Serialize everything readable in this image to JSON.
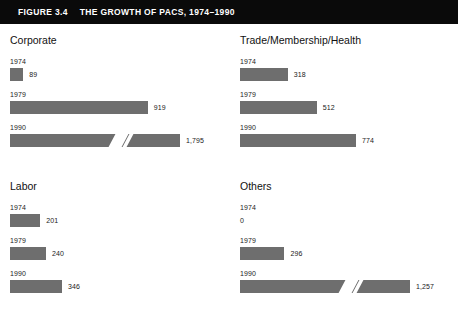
{
  "header": {
    "figure_label": "FIGURE 3.4",
    "title": "THE GROWTH OF PACS, 1974–1990"
  },
  "chart_data": {
    "type": "bar",
    "title": "THE GROWTH OF PACS, 1974–1990",
    "xlabel": "",
    "ylabel": "",
    "orientation": "horizontal",
    "grid": false,
    "legend": "none",
    "categories": [
      "1974",
      "1979",
      "1990"
    ],
    "value_axis_max": 1000,
    "panels": [
      {
        "id": "corporate",
        "title": "Corporate",
        "bars": [
          {
            "year": "1974",
            "value": 89,
            "label": "89",
            "broken": false
          },
          {
            "year": "1979",
            "value": 919,
            "label": "919",
            "broken": false
          },
          {
            "year": "1990",
            "value": 1795,
            "label": "1,795",
            "broken": true
          }
        ]
      },
      {
        "id": "trade-membership-health",
        "title": "Trade/Membership/Health",
        "bars": [
          {
            "year": "1974",
            "value": 318,
            "label": "318",
            "broken": false
          },
          {
            "year": "1979",
            "value": 512,
            "label": "512",
            "broken": false
          },
          {
            "year": "1990",
            "value": 774,
            "label": "774",
            "broken": false
          }
        ]
      },
      {
        "id": "labor",
        "title": "Labor",
        "bars": [
          {
            "year": "1974",
            "value": 201,
            "label": "201",
            "broken": false
          },
          {
            "year": "1979",
            "value": 240,
            "label": "240",
            "broken": false
          },
          {
            "year": "1990",
            "value": 346,
            "label": "346",
            "broken": false
          }
        ]
      },
      {
        "id": "others",
        "title": "Others",
        "bars": [
          {
            "year": "1974",
            "value": 0,
            "label": "0",
            "broken": false
          },
          {
            "year": "1979",
            "value": 296,
            "label": "296",
            "broken": false
          },
          {
            "year": "1990",
            "value": 1257,
            "label": "1,257",
            "broken": true
          }
        ]
      }
    ]
  },
  "colors": {
    "bar": "#6e6e6e",
    "header_band": "#0a0a0a",
    "header_text": "#ffffff",
    "background": "#ffffff",
    "text": "#1a1a1a"
  }
}
